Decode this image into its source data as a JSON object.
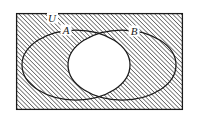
{
  "figure": {
    "name": "venn-diagram-symmetric-difference",
    "background_color": "#ffffff",
    "stroke_color": "#1a1a1a",
    "hatch_color": "#4d4d4d",
    "shaded_fill_description": "diagonal hatch lines at 45 degrees rising to the right",
    "unshaded_region": "intersection lens of A and B is white"
  },
  "labels": {
    "universe": "U",
    "set_a": "A",
    "set_b": "B"
  },
  "geometry": {
    "rectangle": {
      "x": 16,
      "y": 13,
      "width": 167,
      "height": 97
    },
    "ellipse_a": {
      "cx": 76,
      "cy": 65,
      "rx": 54,
      "ry": 35
    },
    "ellipse_b": {
      "cx": 122,
      "cy": 65,
      "rx": 54,
      "ry": 35
    },
    "label_u_pos": {
      "x": 52,
      "y": 22
    },
    "label_a_pos": {
      "x": 66,
      "y": 34
    },
    "label_b_pos": {
      "x": 134,
      "y": 35
    }
  }
}
